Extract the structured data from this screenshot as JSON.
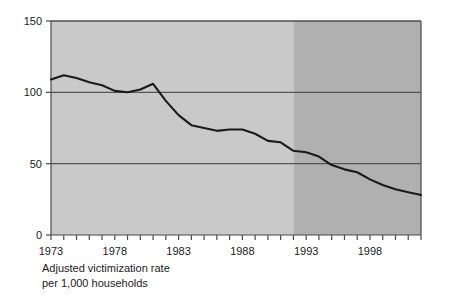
{
  "chart_data": {
    "type": "line",
    "title": "",
    "subtitle": "",
    "caption_line1": "Adjusted victimization rate",
    "caption_line2": "per 1,000 households",
    "xlabel": "",
    "ylabel": "",
    "ylim": [
      0,
      150
    ],
    "xlim": [
      1973,
      2002
    ],
    "grid": true,
    "grid_lines_y": [
      50,
      100,
      150
    ],
    "legend": "none",
    "y_ticks": [
      0,
      50,
      100,
      150
    ],
    "y_tick_labels": [
      "0",
      "50",
      "100",
      "150"
    ],
    "x_ticks": [
      1973,
      1974,
      1975,
      1976,
      1977,
      1978,
      1979,
      1980,
      1981,
      1982,
      1983,
      1984,
      1985,
      1986,
      1987,
      1988,
      1989,
      1990,
      1991,
      1992,
      1993,
      1994,
      1995,
      1996,
      1997,
      1998,
      1999,
      2000,
      2001,
      2002
    ],
    "x_tick_labels_shown": [
      "1973",
      "1978",
      "1983",
      "1988",
      "1993",
      "1998"
    ],
    "x_labeled_years": [
      1973,
      1978,
      1983,
      1988,
      1993,
      1998
    ],
    "x": [
      1973,
      1974,
      1975,
      1976,
      1977,
      1978,
      1979,
      1980,
      1981,
      1982,
      1983,
      1984,
      1985,
      1986,
      1987,
      1988,
      1989,
      1990,
      1991,
      1992,
      1993,
      1994,
      1995,
      1996,
      1997,
      1998,
      1999,
      2000,
      2001,
      2002
    ],
    "values": [
      109,
      112,
      110,
      107,
      105,
      101,
      100,
      102,
      106,
      94,
      84,
      77,
      75,
      73,
      74,
      74,
      71,
      66,
      65,
      59,
      58,
      55,
      49,
      46,
      44,
      39,
      35,
      32,
      30,
      28
    ],
    "series": [
      {
        "name": "Adjusted victimization rate per 1,000 households",
        "values": [
          109,
          112,
          110,
          107,
          105,
          101,
          100,
          102,
          106,
          94,
          84,
          77,
          75,
          73,
          74,
          74,
          71,
          66,
          65,
          59,
          58,
          55,
          49,
          46,
          44,
          39,
          35,
          32,
          30,
          28
        ],
        "color": "#1a1a1a"
      }
    ],
    "shaded_regions": [
      {
        "name": "light-band",
        "from": 1973,
        "to": 1992,
        "color": "#c9c9c9"
      },
      {
        "name": "dark-band",
        "from": 1992,
        "to": 2002,
        "color": "#b0b0b0"
      }
    ],
    "colors": {
      "line": "#1a1a1a",
      "axis": "#4a4a4a",
      "gridline": "#555555",
      "plot_light": "#c9c9c9",
      "plot_dark": "#b0b0b0",
      "text": "#1a1a1a",
      "background": "#ffffff"
    }
  }
}
